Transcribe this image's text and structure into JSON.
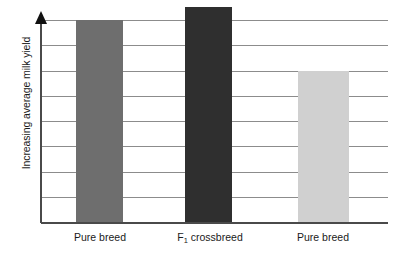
{
  "chart_data": {
    "type": "bar",
    "title": "",
    "subtitle": "",
    "xlabel": "",
    "ylabel": "Increasing average milk yield",
    "categories": [
      "Pure breed",
      "F₁ crossbreed",
      "Pure breed"
    ],
    "category_parts": [
      {
        "main": "Pure breed",
        "sub": ""
      },
      {
        "main": "F",
        "sub": "1",
        "tail": " crossbreed"
      },
      {
        "main": "Pure breed",
        "sub": ""
      }
    ],
    "values": [
      7,
      8.5,
      5
    ],
    "value_units": "relative (unlabelled axis)",
    "ylim": [
      0,
      8.5
    ],
    "y_tick_labels": [],
    "y_axis_has_numeric_ticks": false,
    "y_axis_arrow": "up",
    "gridlines": {
      "visible": true,
      "orientation": "horizontal",
      "count": 8,
      "color": "#8c8c8c"
    },
    "legend": {
      "visible": false,
      "position": "none"
    },
    "annotations": [],
    "series": [
      {
        "name": "Average milk yield",
        "values": [
          7,
          8.5,
          5
        ],
        "bar_colors": [
          "#6e6e6e",
          "#2f2f2f",
          "#d0d0d0"
        ]
      }
    ],
    "colors": {
      "bar_pure_breed_left": "#6e6e6e",
      "bar_f1_crossbreed": "#2f2f2f",
      "bar_pure_breed_right": "#d0d0d0",
      "gridline": "#8c8c8c",
      "axis": "#4a4a4a",
      "arrow": "#111111",
      "text": "#1a1a1a",
      "background": "#ffffff"
    }
  },
  "axis": {
    "y_title": "Increasing average milk yield"
  },
  "bars": [
    {
      "label": "Pure breed",
      "color": "#6e6e6e",
      "left": 35,
      "width": 47,
      "top": 20,
      "height": 202
    },
    {
      "label": "F1 crossbreed",
      "color": "#2f2f2f",
      "left": 144,
      "width": 47,
      "top": 7,
      "height": 215
    },
    {
      "label": "Pure breed",
      "color": "#d0d0d0",
      "left": 257,
      "width": 51,
      "top": 71,
      "height": 151
    }
  ],
  "gridlines": [
    20,
    45,
    71,
    96,
    121,
    146,
    172,
    197
  ],
  "baseline_y": 222,
  "labels": [
    {
      "text": "Pure breed",
      "left": 60,
      "width": 80
    },
    {
      "text": "F",
      "sub": "1",
      "tail": " crossbreed",
      "left": 160,
      "width": 100
    },
    {
      "text": "Pure breed",
      "left": 283,
      "width": 80
    }
  ]
}
